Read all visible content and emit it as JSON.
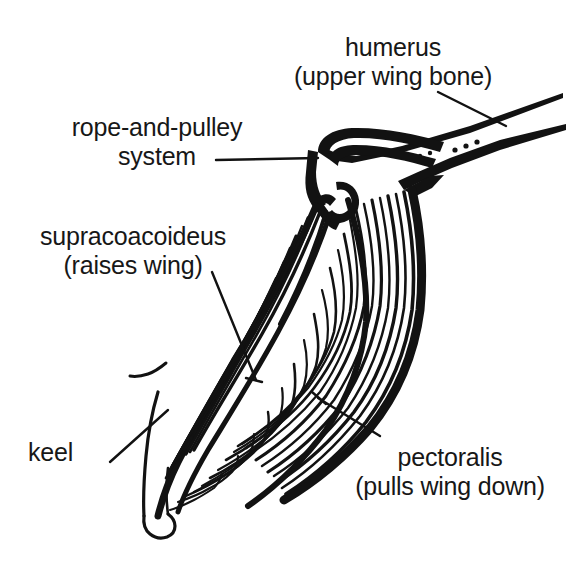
{
  "figure": {
    "background_color": "#ffffff",
    "ink_color": "#121212",
    "width": 570,
    "height": 568
  },
  "labels": {
    "humerus": {
      "line1": "humerus",
      "line2": "(upper wing bone)",
      "align": "center"
    },
    "rope_and_pulley": {
      "line1": "rope-and-pulley",
      "line2": "system",
      "align": "center"
    },
    "supracoacoideus": {
      "line1": "supracoacoideus",
      "line2": "(raises wing)",
      "align": "center"
    },
    "keel": {
      "line1": "keel",
      "align": "left"
    },
    "pectoralis": {
      "line1": "pectoralis",
      "line2": "(pulls wing down)",
      "align": "center"
    }
  },
  "parts": [
    {
      "name": "humerus",
      "description": "upper wing bone"
    },
    {
      "name": "rope-and-pulley system",
      "description": "supracoacoideus tendon over shoulder"
    },
    {
      "name": "supracoacoideus",
      "description": "raises wing"
    },
    {
      "name": "keel",
      "description": "sternum ridge"
    },
    {
      "name": "pectoralis",
      "description": "pulls wing down"
    }
  ]
}
